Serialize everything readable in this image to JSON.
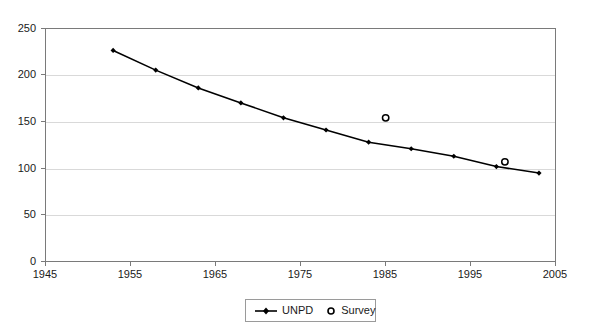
{
  "chart_data": {
    "type": "line",
    "title": "",
    "subtitle": "",
    "xlabel": "",
    "ylabel": "",
    "xlim": [
      1945,
      2005
    ],
    "ylim": [
      0,
      250
    ],
    "xticks": [
      1945,
      1955,
      1965,
      1975,
      1985,
      1995,
      2005
    ],
    "yticks": [
      0,
      50,
      100,
      150,
      200,
      250
    ],
    "grid": "horizontal",
    "legend_position": "bottom-center",
    "series": [
      {
        "name": "UNPD",
        "type": "line",
        "marker": "filled-diamond",
        "color": "#000000",
        "x": [
          1953,
          1958,
          1963,
          1968,
          1973,
          1978,
          1983,
          1988,
          1993,
          1998,
          2003
        ],
        "values": [
          226,
          205,
          186,
          170,
          154,
          141,
          128,
          121,
          113,
          102,
          95
        ]
      },
      {
        "name": "Survey",
        "type": "scatter",
        "marker": "open-circle",
        "color": "#000000",
        "x": [
          1985,
          1999
        ],
        "values": [
          154,
          107
        ]
      }
    ],
    "legend": [
      {
        "label": "UNPD",
        "marker": "line-filled-diamond"
      },
      {
        "label": "Survey",
        "marker": "open-circle"
      }
    ],
    "ytick_labels": [
      "0",
      "50",
      "100",
      "150",
      "200",
      "250"
    ],
    "xtick_labels": [
      "1945",
      "1955",
      "1965",
      "1975",
      "1985",
      "1995",
      "2005"
    ]
  },
  "colors": {
    "series_line": "#000000",
    "axis": "#7a7a7a",
    "gridline": "#d9d9d9",
    "text": "#1a1a1a",
    "background": "#ffffff"
  }
}
